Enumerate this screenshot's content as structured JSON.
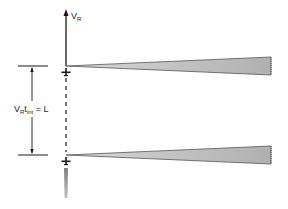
{
  "diagram": {
    "velocity_label": {
      "main": "V",
      "sub": "R"
    },
    "dimension_label": {
      "v": "V",
      "v_sub": "R",
      "t": "t",
      "t_sub": "int",
      "rest": " = L"
    },
    "colors": {
      "line": "#1a1a1a",
      "wedge_fill": "#b8b8b8",
      "wedge_edge": "#555555",
      "exhaust": "#9a9a9a",
      "background": "#ffffff"
    },
    "elements": [
      {
        "id": "velocity-vector",
        "description": "upward arrow representing platform velocity V_R"
      },
      {
        "id": "beam-footprint-top",
        "description": "radar beam wedge at first aircraft position"
      },
      {
        "id": "beam-footprint-bottom",
        "description": "radar beam wedge at second aircraft position"
      },
      {
        "id": "flight-path",
        "description": "dashed line connecting aircraft positions"
      },
      {
        "id": "integration-length",
        "description": "dimension arrow labeled V_R t_int = L"
      }
    ]
  }
}
